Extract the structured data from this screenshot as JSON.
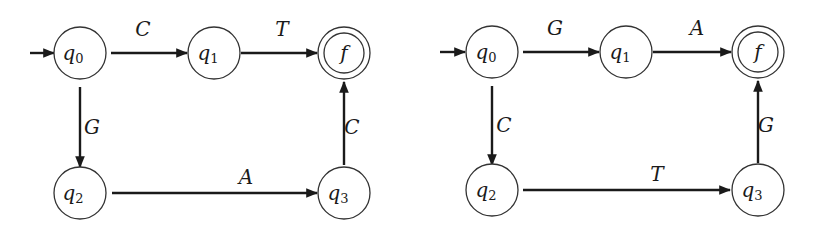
{
  "diagrams": [
    {
      "id": "left",
      "states": {
        "q0": {
          "name": "q",
          "sub": "0"
        },
        "q1": {
          "name": "q",
          "sub": "1"
        },
        "q2": {
          "name": "q",
          "sub": "2"
        },
        "q3": {
          "name": "q",
          "sub": "3"
        },
        "f": {
          "name": "f",
          "final": true
        }
      },
      "start_state": "q0",
      "transitions": [
        {
          "from": "q0",
          "to": "q1",
          "label": "C"
        },
        {
          "from": "q1",
          "to": "f",
          "label": "T"
        },
        {
          "from": "q0",
          "to": "q2",
          "label": "G"
        },
        {
          "from": "q2",
          "to": "q3",
          "label": "A"
        },
        {
          "from": "q3",
          "to": "f",
          "label": "C"
        }
      ]
    },
    {
      "id": "right",
      "states": {
        "q0": {
          "name": "q",
          "sub": "0"
        },
        "q1": {
          "name": "q",
          "sub": "1"
        },
        "q2": {
          "name": "q",
          "sub": "2"
        },
        "q3": {
          "name": "q",
          "sub": "3"
        },
        "f": {
          "name": "f",
          "final": true
        }
      },
      "start_state": "q0",
      "transitions": [
        {
          "from": "q0",
          "to": "q1",
          "label": "G"
        },
        {
          "from": "q1",
          "to": "f",
          "label": "A"
        },
        {
          "from": "q0",
          "to": "q2",
          "label": "C"
        },
        {
          "from": "q2",
          "to": "q3",
          "label": "T"
        },
        {
          "from": "q3",
          "to": "f",
          "label": "G"
        }
      ]
    }
  ]
}
